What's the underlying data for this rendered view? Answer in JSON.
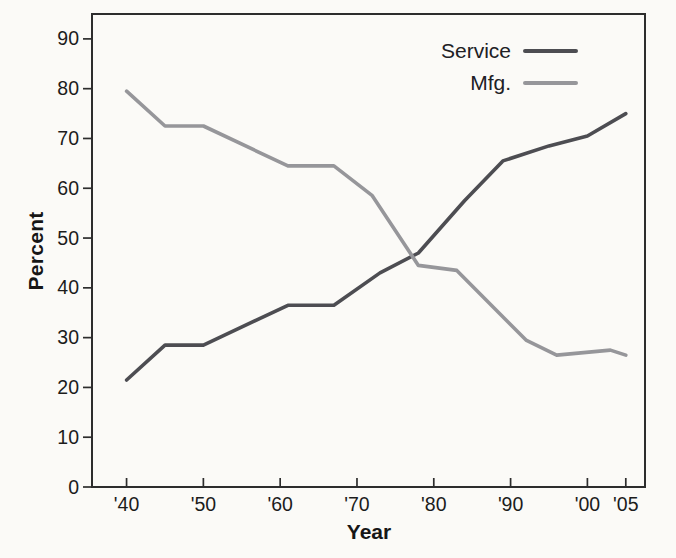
{
  "figure": {
    "background": "#fbfaf7",
    "axis_color": "#2d2d2d",
    "text_color": "#1c1c1c"
  },
  "chart_data": {
    "type": "line",
    "title": "",
    "xlabel": "Year",
    "ylabel": "Percent",
    "xlim": [
      1935.5,
      2007.5
    ],
    "ylim": [
      0,
      95
    ],
    "grid": false,
    "legend_position": "top-right",
    "x_ticks": [
      {
        "value": 1940,
        "label": "'40"
      },
      {
        "value": 1950,
        "label": "'50"
      },
      {
        "value": 1960,
        "label": "'60"
      },
      {
        "value": 1970,
        "label": "'70"
      },
      {
        "value": 1980,
        "label": "'80"
      },
      {
        "value": 1990,
        "label": "'90"
      },
      {
        "value": 2000,
        "label": "'00"
      },
      {
        "value": 2005,
        "label": "'05"
      }
    ],
    "y_ticks": [
      {
        "value": 0,
        "label": "0"
      },
      {
        "value": 10,
        "label": "10"
      },
      {
        "value": 20,
        "label": "20"
      },
      {
        "value": 30,
        "label": "30"
      },
      {
        "value": 40,
        "label": "40"
      },
      {
        "value": 50,
        "label": "50"
      },
      {
        "value": 60,
        "label": "60"
      },
      {
        "value": 70,
        "label": "70"
      },
      {
        "value": 80,
        "label": "80"
      },
      {
        "value": 90,
        "label": "90"
      }
    ],
    "series": [
      {
        "name": "Service",
        "color": "#4d4d52",
        "stroke_width": 3.6,
        "points": [
          [
            1940,
            21.5
          ],
          [
            1945,
            28.5
          ],
          [
            1950,
            28.5
          ],
          [
            1961,
            36.5
          ],
          [
            1967,
            36.5
          ],
          [
            1973,
            43.0
          ],
          [
            1978,
            47.0
          ],
          [
            1984,
            57.5
          ],
          [
            1989,
            65.5
          ],
          [
            1995,
            68.5
          ],
          [
            2000,
            70.5
          ],
          [
            2005,
            75.0
          ]
        ]
      },
      {
        "name": "Mfg.",
        "color": "#96969a",
        "stroke_width": 3.6,
        "points": [
          [
            1940,
            79.5
          ],
          [
            1945,
            72.5
          ],
          [
            1950,
            72.5
          ],
          [
            1961,
            64.5
          ],
          [
            1967,
            64.5
          ],
          [
            1972,
            58.5
          ],
          [
            1978,
            44.5
          ],
          [
            1983,
            43.5
          ],
          [
            1992,
            29.5
          ],
          [
            1996,
            26.5
          ],
          [
            2003,
            27.5
          ],
          [
            2005,
            26.5
          ]
        ]
      }
    ]
  }
}
